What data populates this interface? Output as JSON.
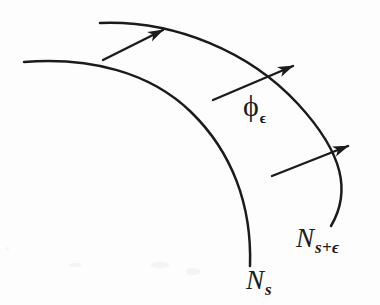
{
  "figure": {
    "background_color": "#fdfdfd",
    "ink_color": "#1b1b1b",
    "width": 380,
    "height": 305
  },
  "labels": {
    "flow_map": {
      "base": "ϕ",
      "subscript": "ϵ",
      "full": "ϕϵ"
    },
    "inner_curve": {
      "base": "N",
      "subscript": "s",
      "full": "Ns"
    },
    "outer_curve": {
      "base": "N",
      "subscript": "s+ϵ",
      "full": "Ns+ϵ"
    }
  },
  "chart_data": {
    "type": "diagram",
    "curves": [
      {
        "name": "inner-curve",
        "label": "Ns",
        "role": "inner-hypersurface",
        "start": [
          24,
          62
        ],
        "end": [
          250,
          266
        ],
        "path": "M24,62 C90,57 150,72 191,112 C232,152 252,205 250,266"
      },
      {
        "name": "outer-curve",
        "label": "Ns+ϵ",
        "role": "outer-hypersurface",
        "start": [
          100,
          23
        ],
        "end": [
          331,
          226
        ],
        "path": "M100,23 C175,20 250,52 298,104 C344,154 351,192 331,226"
      }
    ],
    "arrows": [
      {
        "name": "arrow-top",
        "from": [
          103,
          60
        ],
        "to": [
          163,
          30
        ]
      },
      {
        "name": "arrow-middle",
        "from": [
          213,
          100
        ],
        "to": [
          293,
          66
        ]
      },
      {
        "name": "arrow-bottom",
        "from": [
          272,
          176
        ],
        "to": [
          348,
          146
        ]
      }
    ]
  }
}
